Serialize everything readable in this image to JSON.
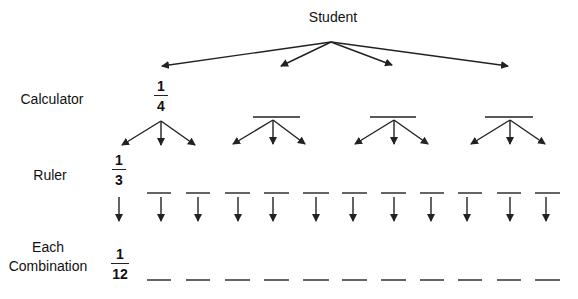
{
  "diagram": {
    "type": "tree",
    "title": "Student",
    "levels": [
      {
        "label": "Calculator",
        "probability": "1/4",
        "num": "1",
        "den": "4",
        "branches": 4
      },
      {
        "label": "Ruler",
        "probability": "1/3",
        "num": "1",
        "den": "3",
        "branches_per_node": 3
      },
      {
        "label_line1": "Each",
        "label_line2": "Combination",
        "probability": "1/12",
        "num": "1",
        "den": "12",
        "outcomes": 12
      }
    ],
    "colors": {
      "line": "#222222",
      "text": "#111111",
      "background": "#ffffff"
    }
  },
  "labels": {
    "root": "Student",
    "calculator": "Calculator",
    "ruler": "Ruler",
    "each": "Each",
    "combination": "Combination"
  },
  "fractions": {
    "calculator": {
      "num": "1",
      "den": "4"
    },
    "ruler": {
      "num": "1",
      "den": "3"
    },
    "combination": {
      "num": "1",
      "den": "12"
    }
  }
}
